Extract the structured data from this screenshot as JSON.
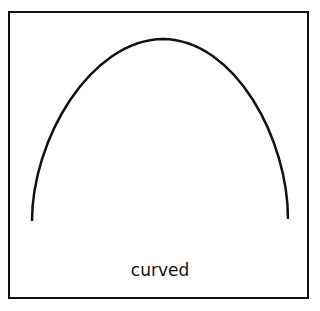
{
  "diagram": {
    "label": "curved",
    "stroke_color": "#111111",
    "background": "#ffffff",
    "curve": {
      "type": "arch",
      "start": [
        32,
        221
      ],
      "peak": [
        163,
        39
      ],
      "end": [
        288,
        219
      ]
    }
  }
}
